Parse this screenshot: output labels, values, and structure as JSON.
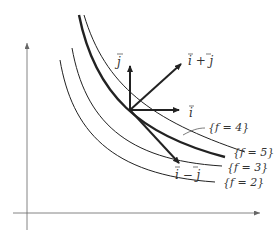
{
  "diagram": {
    "vectors": [
      {
        "id": "j",
        "label": "j",
        "label_full": "j⃗"
      },
      {
        "id": "i_plus_j",
        "label": "i + j"
      },
      {
        "id": "i",
        "label": "i"
      },
      {
        "id": "i_minus_j",
        "label": "i − j"
      }
    ],
    "level_curves": [
      {
        "id": "f2",
        "label": "{f = 2}"
      },
      {
        "id": "f3",
        "label": "{f = 3}"
      },
      {
        "id": "f4",
        "label": "{f = 4}"
      },
      {
        "id": "f5",
        "label": "{f = 5}"
      }
    ],
    "colors": {
      "ink": "#222222",
      "axis": "#666666"
    }
  }
}
